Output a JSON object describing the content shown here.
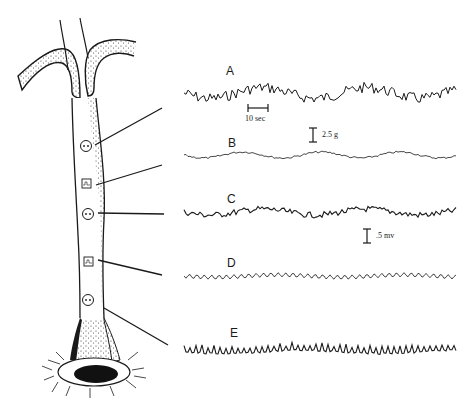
{
  "figure": {
    "type": "diagram",
    "ink_color": "#1a1a1a",
    "background": "#ffffff"
  },
  "tree": {
    "sensors": [
      {
        "id": "A",
        "kind": "electrode",
        "symbol": "circle-two-dots",
        "y": 146
      },
      {
        "id": "B",
        "kind": "accelerometer",
        "symbol": "square-wave-box",
        "y": 184
      },
      {
        "id": "C",
        "kind": "electrode",
        "symbol": "circle-two-dots",
        "y": 214
      },
      {
        "id": "D",
        "kind": "accelerometer",
        "symbol": "square-wave-box",
        "y": 261
      },
      {
        "id": "E",
        "kind": "electrode",
        "symbol": "circle-two-dots",
        "y": 300
      }
    ]
  },
  "traces": [
    {
      "label": "A",
      "y": 93,
      "amplitude": 9,
      "style": "irregular-large"
    },
    {
      "label": "B",
      "y": 155,
      "amplitude": 3,
      "style": "low-amplitude"
    },
    {
      "label": "C",
      "y": 212,
      "amplitude": 5,
      "style": "irregular-medium"
    },
    {
      "label": "D",
      "y": 276,
      "amplitude": 3,
      "style": "regular-oscillation"
    },
    {
      "label": "E",
      "y": 351,
      "amplitude": 6,
      "style": "spiky"
    }
  ],
  "scale_bars": {
    "time": {
      "label": "10 sec"
    },
    "force": {
      "label": "2.5 g"
    },
    "voltage": {
      "label": ".5 mv"
    }
  }
}
